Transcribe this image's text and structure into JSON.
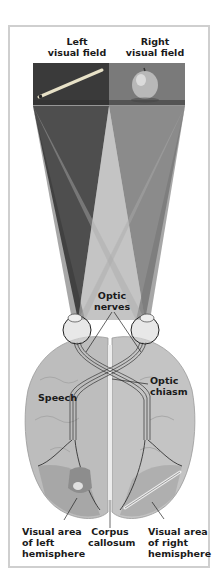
{
  "fields": {
    "left_label": "Left\nvisual field",
    "right_label": "Right\nvisual field"
  },
  "labels": {
    "optic_nerves": "Optic\nnerves",
    "optic_chiasm": "Optic\nchiasm",
    "speech": "Speech",
    "visual_left": "Visual area\nof left\nhemisphere",
    "corpus_callosum": "Corpus\ncallosum",
    "visual_right": "Visual area\nof right\nhemisphere"
  },
  "icons": {
    "left_object": "pencil-icon",
    "right_object": "apple-icon"
  },
  "colors": {
    "left_field": "#3a3a3a",
    "right_field": "#7a7a7a",
    "brain": "#bdbdbd",
    "frame": "#cfcfcf"
  }
}
